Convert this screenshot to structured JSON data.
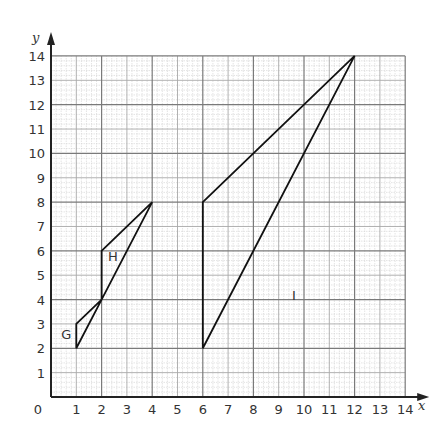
{
  "chart_data": {
    "type": "scatter",
    "title": "",
    "xlabel": "x",
    "ylabel": "y",
    "xlim": [
      0,
      14
    ],
    "ylim": [
      0,
      14
    ],
    "grid": true,
    "x_ticks": [
      "0",
      "1",
      "2",
      "3",
      "4",
      "5",
      "6",
      "7",
      "8",
      "9",
      "10",
      "11",
      "12",
      "13",
      "14"
    ],
    "y_ticks": [
      "1",
      "2",
      "3",
      "4",
      "5",
      "6",
      "7",
      "8",
      "9",
      "10",
      "11",
      "12",
      "13",
      "14"
    ],
    "shapes": [
      {
        "name": "G",
        "type": "triangle",
        "vertices": [
          [
            1,
            2
          ],
          [
            1,
            3
          ],
          [
            2,
            4
          ]
        ],
        "label_pos": [
          0.6,
          2.6
        ]
      },
      {
        "name": "H",
        "type": "triangle",
        "vertices": [
          [
            2,
            4
          ],
          [
            2,
            6
          ],
          [
            4,
            8
          ]
        ],
        "label_pos": [
          2.45,
          5.8
        ]
      },
      {
        "name": "I",
        "type": "triangle",
        "vertices": [
          [
            6,
            2
          ],
          [
            6,
            8
          ],
          [
            12,
            14
          ]
        ],
        "label_pos": [
          9.6,
          4.2
        ]
      }
    ]
  },
  "layout": {
    "origin_px": [
      51,
      397
    ],
    "unit_x_px": 25.3,
    "unit_y_px": 24.36,
    "colors": {
      "axis": "#222222",
      "major_grid": "#7a7a7a",
      "unit_grid": "#a8a8a8",
      "minor_grid": "#d2d2d2",
      "shape": "#111111"
    }
  }
}
